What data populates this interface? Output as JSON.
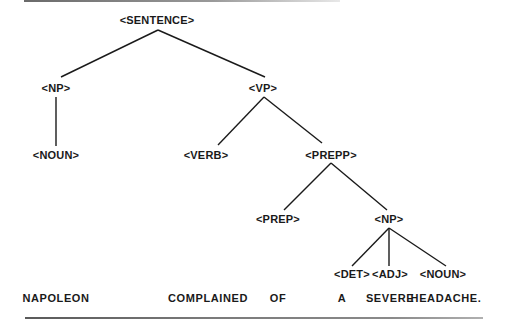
{
  "diagram": {
    "type": "parse-tree",
    "nodes": {
      "sentence": "<SENTENCE>",
      "np_subject": "<NP>",
      "vp": "<VP>",
      "noun_subject": "<NOUN>",
      "verb": "<VERB>",
      "prepp": "<PREPP>",
      "prep": "<PREP>",
      "np_object": "<NP>",
      "det": "<DET>",
      "adj": "<ADJ>",
      "noun_object": "<NOUN>"
    },
    "words": [
      "NAPOLEON",
      "COMPLAINED",
      "OF",
      "A",
      "SEVERE",
      "HEADACHE."
    ],
    "edges": [
      [
        "sentence",
        "np_subject"
      ],
      [
        "sentence",
        "vp"
      ],
      [
        "np_subject",
        "noun_subject"
      ],
      [
        "vp",
        "verb"
      ],
      [
        "vp",
        "prepp"
      ],
      [
        "prepp",
        "prep"
      ],
      [
        "prepp",
        "np_object"
      ],
      [
        "np_object",
        "det"
      ],
      [
        "np_object",
        "adj"
      ],
      [
        "np_object",
        "noun_object"
      ]
    ],
    "colors": {
      "line": "#1a1a1a",
      "text": "#1a1a1a",
      "background": "#ffffff"
    }
  }
}
